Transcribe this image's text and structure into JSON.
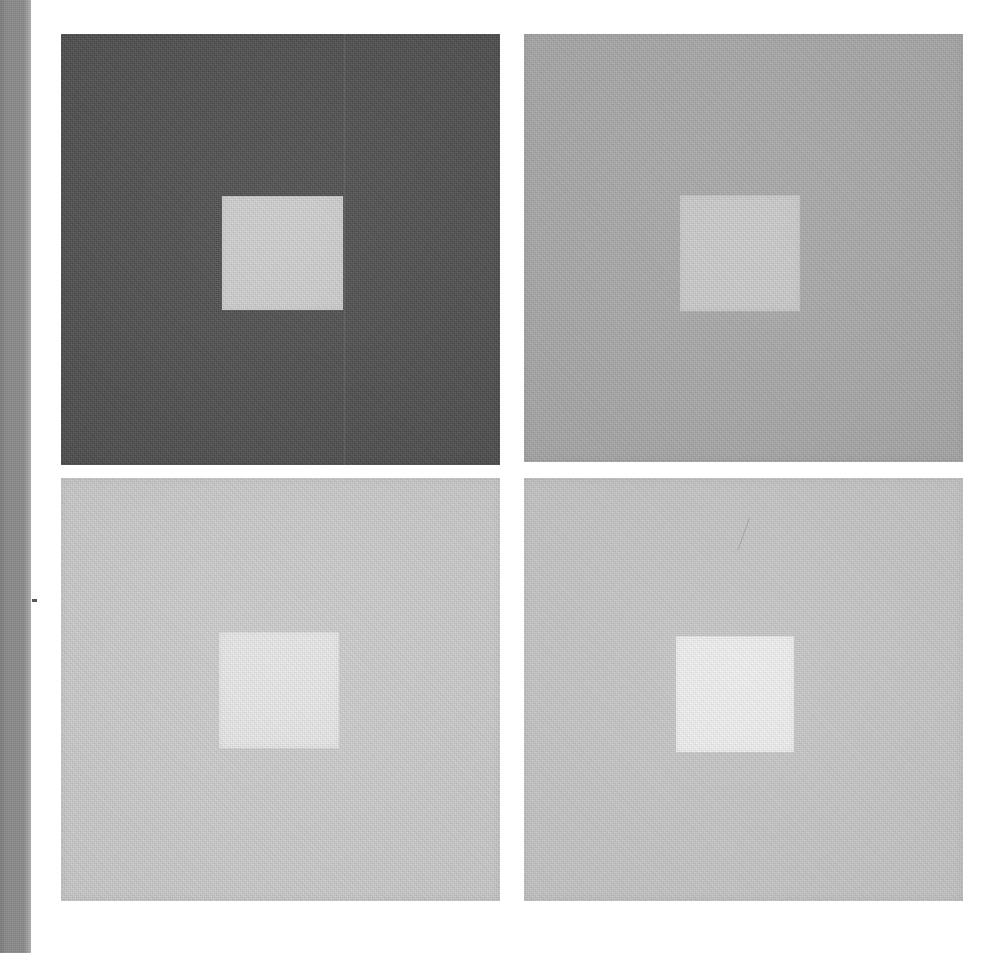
{
  "figure": {
    "kind": "simultaneous-contrast-plate",
    "width": 999,
    "height": 953,
    "page_background": "#ffffff",
    "gutter": {
      "color": "#8b8b8b",
      "x": 0,
      "y": 0,
      "width": 31,
      "height": 953
    },
    "margin_tick": {
      "color": "#3a3a3a",
      "x": 32,
      "y": 599,
      "width": 5,
      "height": 3
    }
  },
  "panels": [
    {
      "id": "panel-1",
      "position": "top-left",
      "x": 61,
      "y": 34,
      "width": 439,
      "height": 431,
      "background_color": "#4a4a4a",
      "inner": {
        "x": 161,
        "y": 162,
        "width": 121,
        "height": 114,
        "color": "#cdcdcd"
      },
      "marks": [
        "vertical-seam"
      ]
    },
    {
      "id": "panel-2",
      "position": "top-right",
      "x": 524,
      "y": 34,
      "width": 439,
      "height": 428,
      "background_color": "#a8a8a8",
      "inner": {
        "x": 156,
        "y": 161,
        "width": 120,
        "height": 116,
        "color": "#c9c9c9"
      },
      "marks": []
    },
    {
      "id": "panel-3",
      "position": "bottom-left",
      "x": 61,
      "y": 478,
      "width": 439,
      "height": 423,
      "background_color": "#cdcdcd",
      "inner": {
        "x": 158,
        "y": 154,
        "width": 120,
        "height": 116,
        "color": "#e9e9e9"
      },
      "marks": []
    },
    {
      "id": "panel-4",
      "position": "bottom-right",
      "x": 524,
      "y": 478,
      "width": 439,
      "height": 423,
      "background_color": "#c8c8c8",
      "inner": {
        "x": 152,
        "y": 158,
        "width": 118,
        "height": 116,
        "color": "#f2f2f2"
      },
      "marks": [
        "diagonal-pencil-stroke"
      ]
    }
  ]
}
